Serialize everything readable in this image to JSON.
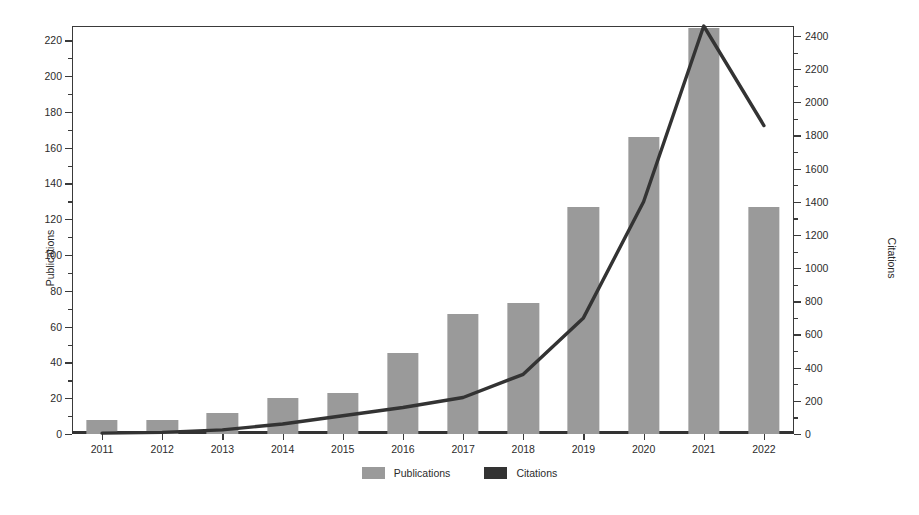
{
  "chart_data": {
    "type": "bar",
    "title": "",
    "subtitle": "",
    "xlabel": "",
    "ylabel": "Publications",
    "y2label": "Citations",
    "categories": [
      "2011",
      "2012",
      "2013",
      "2014",
      "2015",
      "2016",
      "2017",
      "2018",
      "2019",
      "2020",
      "2021",
      "2022"
    ],
    "series": [
      {
        "name": "Publications",
        "type": "bar",
        "axis": "left",
        "color": "#9a9a9a",
        "values": [
          8,
          8,
          12,
          20,
          23,
          45,
          67,
          73,
          127,
          166,
          227,
          127
        ]
      },
      {
        "name": "Citations",
        "type": "line",
        "axis": "right",
        "color": "#333333",
        "values": [
          5,
          10,
          25,
          60,
          110,
          160,
          220,
          360,
          700,
          1400,
          2460,
          1860
        ]
      }
    ],
    "ylim": [
      0,
      228
    ],
    "y2lim": [
      0,
      2460
    ],
    "yticks": [
      0,
      20,
      40,
      60,
      80,
      100,
      120,
      140,
      160,
      180,
      200,
      220
    ],
    "y2ticks": [
      0,
      200,
      400,
      600,
      800,
      1000,
      1200,
      1400,
      1600,
      1800,
      2000,
      2200,
      2400
    ],
    "grid": false,
    "legend": {
      "position": "bottom",
      "entries": [
        {
          "label": "Publications",
          "color": "#9a9a9a"
        },
        {
          "label": "Citations",
          "color": "#333333"
        }
      ]
    }
  },
  "caption": ""
}
